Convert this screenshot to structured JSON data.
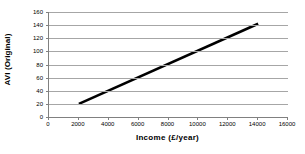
{
  "chart_data": {
    "type": "line",
    "title": "",
    "xlabel": "Income (£/year)",
    "ylabel": "AVI (Original)",
    "xlim": [
      0,
      16000
    ],
    "ylim": [
      0,
      160
    ],
    "grid": true,
    "grid_axis": "y",
    "legend": "none",
    "x_ticks": [
      0,
      2000,
      4000,
      6000,
      8000,
      10000,
      12000,
      14000,
      16000
    ],
    "x_tick_labels": [
      "0",
      "2000",
      "4000",
      "6000",
      "8000",
      "10000",
      "12000",
      "14000",
      "16000"
    ],
    "y_ticks": [
      0,
      20,
      40,
      60,
      80,
      100,
      120,
      140,
      160
    ],
    "y_tick_labels": [
      "0",
      "20",
      "40",
      "60",
      "80",
      "100",
      "120",
      "140",
      "160"
    ],
    "series": [
      {
        "name": "AVI (Original)",
        "color": "#000000",
        "line_width": 2.6,
        "x": [
          2000,
          14000
        ],
        "values": [
          20,
          142
        ]
      }
    ]
  },
  "axes": {
    "y_title": "AVI (Original)",
    "x_title": "Income (£/year)"
  }
}
